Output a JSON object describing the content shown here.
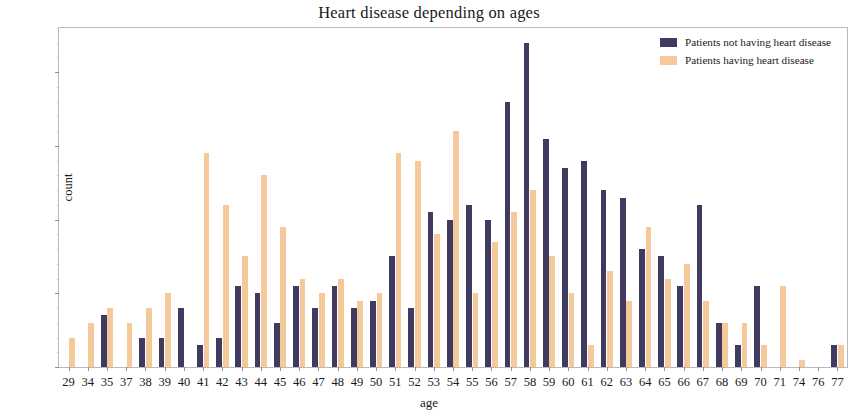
{
  "chart_data": {
    "type": "bar",
    "title": "Heart disease depending on ages",
    "xlabel": "age",
    "ylabel": "count",
    "ylim": [
      0,
      46
    ],
    "yticks": [
      0,
      10,
      20,
      30,
      40
    ],
    "grid": false,
    "legend_position": "top-right",
    "colors": {
      "not_having": "#3f3a5f",
      "having": "#f6c99b"
    },
    "categories": [
      "29",
      "34",
      "35",
      "37",
      "38",
      "39",
      "40",
      "41",
      "42",
      "43",
      "44",
      "45",
      "46",
      "47",
      "48",
      "49",
      "50",
      "51",
      "52",
      "53",
      "54",
      "55",
      "56",
      "57",
      "58",
      "59",
      "60",
      "61",
      "62",
      "63",
      "64",
      "65",
      "66",
      "67",
      "68",
      "69",
      "70",
      "71",
      "74",
      "76",
      "77"
    ],
    "series": [
      {
        "name": "Patients not having heart disease",
        "values": [
          0,
          0,
          7,
          0,
          4,
          4,
          8,
          3,
          4,
          11,
          10,
          6,
          11,
          8,
          11,
          8,
          9,
          15,
          8,
          21,
          20,
          22,
          20,
          36,
          44,
          31,
          27,
          28,
          24,
          23,
          16,
          15,
          11,
          22,
          6,
          3,
          11,
          0,
          0,
          0,
          3
        ]
      },
      {
        "name": "Patients having heart disease",
        "values": [
          4,
          6,
          8,
          6,
          8,
          10,
          0,
          29,
          22,
          15,
          26,
          19,
          12,
          10,
          12,
          9,
          10,
          29,
          28,
          18,
          32,
          10,
          17,
          21,
          24,
          15,
          10,
          3,
          13,
          9,
          19,
          12,
          14,
          9,
          6,
          6,
          3,
          11,
          1,
          0,
          3
        ]
      }
    ]
  },
  "legend": {
    "entries": [
      {
        "label": "Patients not having heart disease",
        "color": "#3f3a5f"
      },
      {
        "label": "Patients having heart disease",
        "color": "#f6c99b"
      }
    ]
  }
}
